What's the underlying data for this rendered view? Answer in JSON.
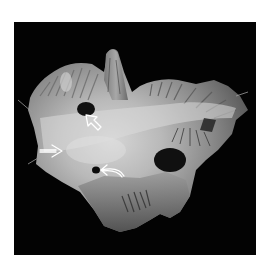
{
  "figure": {
    "background": "#ffffff",
    "frame_color": "#030303",
    "annotations": [
      {
        "type": "open-arrow",
        "direction": "up-left",
        "tip": [
          86,
          115
        ],
        "color": "#ffffff"
      },
      {
        "type": "open-arrow",
        "direction": "right",
        "tip": [
          62,
          151
        ],
        "color": "#ffffff"
      },
      {
        "type": "curved-arrow",
        "direction": "left",
        "tip": [
          101,
          170
        ],
        "color": "#ffffff"
      }
    ]
  }
}
